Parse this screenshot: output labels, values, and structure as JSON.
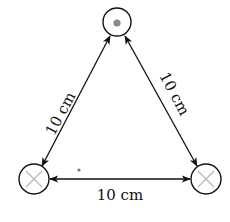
{
  "diagram": {
    "title": "",
    "nodes": [
      {
        "id": "top",
        "symbol": "dot",
        "description": "current out of page",
        "cx": 117,
        "cy": 22,
        "r": 14
      },
      {
        "id": "bottom-left",
        "symbol": "cross",
        "description": "current into page",
        "cx": 34,
        "cy": 179,
        "r": 15
      },
      {
        "id": "bottom-right",
        "symbol": "cross",
        "description": "current into page",
        "cx": 206,
        "cy": 179,
        "r": 15
      }
    ],
    "edges": [
      {
        "from": "top",
        "to": "bottom-left",
        "label": "10 cm",
        "bidirectional": true
      },
      {
        "from": "top",
        "to": "bottom-right",
        "label": "10 cm",
        "bidirectional": true
      },
      {
        "from": "bottom-left",
        "to": "bottom-right",
        "label": "10 cm",
        "bidirectional": true
      }
    ],
    "labels": {
      "left_side": "10 cm",
      "right_side": "10 cm",
      "bottom_side": "10 cm"
    },
    "marker_dot": {
      "x": 79,
      "y": 170
    },
    "colors": {
      "stroke": "#111111",
      "cross": "#b8b8b8",
      "dot": "#8a8a8a",
      "background": "#ffffff"
    }
  }
}
